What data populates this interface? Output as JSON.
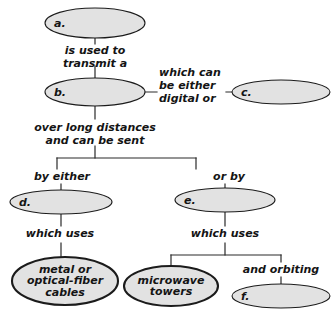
{
  "diagram": {
    "kind": "concept-map",
    "palette": {
      "page_background": "#ffffff",
      "node_fill": "#e2e2e2",
      "node_stroke": "#1b1b1b",
      "connector": "#2a2a2a",
      "text": "#141414"
    },
    "nodes": [
      {
        "id": "a",
        "label": "a.",
        "cx": 95,
        "cy": 23,
        "rx": 50,
        "ry": 15,
        "emphasis": false,
        "multiline": false
      },
      {
        "id": "b",
        "label": "b.",
        "cx": 95,
        "cy": 92,
        "rx": 50,
        "ry": 14,
        "emphasis": false,
        "multiline": false
      },
      {
        "id": "c",
        "label": "c.",
        "cx": 281,
        "cy": 92,
        "rx": 49,
        "ry": 12,
        "emphasis": false,
        "multiline": false
      },
      {
        "id": "d",
        "label": "d.",
        "cx": 61,
        "cy": 202,
        "rx": 51,
        "ry": 12,
        "emphasis": false,
        "multiline": false
      },
      {
        "id": "e",
        "label": "e.",
        "cx": 225,
        "cy": 200,
        "rx": 50,
        "ry": 12,
        "emphasis": false,
        "multiline": false
      },
      {
        "id": "cables",
        "label": "metal or\noptical-fiber\ncables",
        "cx": 65,
        "cy": 281,
        "rx": 53,
        "ry": 24,
        "emphasis": true,
        "multiline": true
      },
      {
        "id": "microwave",
        "label": "microwave\ntowers",
        "cx": 171,
        "cy": 286,
        "rx": 47,
        "ry": 20,
        "emphasis": true,
        "multiline": true
      },
      {
        "id": "f",
        "label": "f.",
        "cx": 281,
        "cy": 296,
        "rx": 49,
        "ry": 12,
        "emphasis": false,
        "multiline": false
      }
    ],
    "edge_labels": [
      {
        "id": "is-used-to-transmit-a",
        "text": "is used to\ntransmit a",
        "x": 95,
        "y": 44,
        "align": "center"
      },
      {
        "id": "which-can-be-either-digital-or",
        "text": "which can\nbe either\ndigital or",
        "x": 159,
        "y": 66,
        "align": "left"
      },
      {
        "id": "over-long-distances-can-be-sent",
        "text": "over long distances\nand can be sent",
        "x": 95,
        "y": 121,
        "align": "center"
      },
      {
        "id": "by-either",
        "text": "by either",
        "x": 62,
        "y": 170,
        "align": "center"
      },
      {
        "id": "or-by",
        "text": "or by",
        "x": 229,
        "y": 170,
        "align": "center"
      },
      {
        "id": "which-uses-left",
        "text": "which uses",
        "x": 60,
        "y": 227,
        "align": "center"
      },
      {
        "id": "which-uses-right",
        "text": "which uses",
        "x": 225,
        "y": 227,
        "align": "center"
      },
      {
        "id": "and-orbiting",
        "text": "and orbiting",
        "x": 281,
        "y": 263,
        "align": "center"
      }
    ],
    "connectors": [
      {
        "id": "a-to-b",
        "d": "M95,38 L95,44 M95,66 L95,78"
      },
      {
        "id": "b-to-c",
        "d": "M145,92 L157,92 M226,92 L232,92"
      },
      {
        "id": "b-to-split",
        "d": "M95,106 L95,119 M95,146 L95,158"
      },
      {
        "id": "split-bar",
        "d": "M57,158 L196,158"
      },
      {
        "id": "split-left-drop",
        "d": "M57,158 L57,169"
      },
      {
        "id": "split-right-drop",
        "d": "M196,158 L196,169"
      },
      {
        "id": "by-either-to-d",
        "d": "M61,184 L61,190"
      },
      {
        "id": "or-by-to-e",
        "d": "M225,184 L225,188"
      },
      {
        "id": "d-to-which-uses",
        "d": "M61,214 L61,226 M61,243 L61,258"
      },
      {
        "id": "e-to-which-uses",
        "d": "M225,212 L225,226 M225,243 L225,255"
      },
      {
        "id": "right-split-bar",
        "d": "M171,255 L281,255"
      },
      {
        "id": "right-split-left",
        "d": "M171,255 L171,266"
      },
      {
        "id": "right-split-right",
        "d": "M281,255 L281,262"
      },
      {
        "id": "orbiting-to-f",
        "d": "M281,277 L281,285"
      }
    ]
  }
}
